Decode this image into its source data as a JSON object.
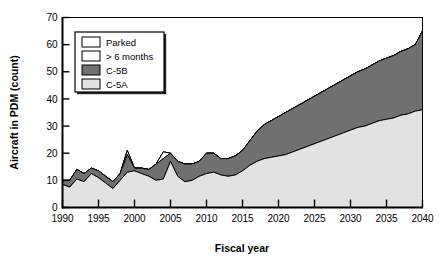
{
  "chart_data": {
    "type": "area",
    "title": "",
    "subtitle": "",
    "xlabel": "Fiscal year",
    "ylabel": "Aircraft in PDM (count)",
    "xlim": [
      1990,
      2040
    ],
    "ylim": [
      0,
      70
    ],
    "xticks": [
      1990,
      1995,
      2000,
      2005,
      2010,
      2015,
      2020,
      2025,
      2030,
      2035,
      2040
    ],
    "yticks": [
      0,
      10,
      20,
      30,
      40,
      50,
      60,
      70
    ],
    "grid": false,
    "stacked": true,
    "legend_position": "top-left-inside",
    "x": [
      1990,
      1991,
      1992,
      1993,
      1994,
      1995,
      1996,
      1997,
      1998,
      1999,
      2000,
      2001,
      2002,
      2003,
      2004,
      2005,
      2006,
      2007,
      2008,
      2009,
      2010,
      2011,
      2012,
      2013,
      2014,
      2015,
      2016,
      2017,
      2018,
      2019,
      2020,
      2021,
      2022,
      2023,
      2024,
      2025,
      2026,
      2027,
      2028,
      2029,
      2030,
      2031,
      2032,
      2033,
      2034,
      2035,
      2036,
      2037,
      2038,
      2039,
      2040
    ],
    "series": [
      {
        "name": "C-5A",
        "color": "#e2e2e2",
        "values": [
          8.5,
          7.5,
          10.5,
          9.5,
          12.5,
          11.0,
          9.0,
          7.0,
          10.0,
          13.0,
          13.5,
          12.5,
          11.5,
          10.0,
          10.5,
          17.0,
          11.5,
          9.5,
          10.0,
          11.5,
          12.5,
          13.0,
          12.0,
          11.5,
          12.0,
          13.5,
          15.5,
          17.0,
          18.0,
          18.5,
          19.0,
          19.5,
          20.5,
          21.5,
          22.5,
          23.5,
          24.5,
          25.5,
          26.5,
          27.5,
          28.5,
          29.5,
          30.0,
          31.0,
          32.0,
          32.5,
          33.0,
          34.0,
          34.5,
          35.5,
          36.0
        ]
      },
      {
        "name": "C-5B",
        "color": "#707070",
        "values": [
          1.5,
          2.5,
          3.5,
          3.0,
          2.0,
          2.5,
          2.5,
          2.5,
          2.5,
          6.5,
          1.0,
          2.0,
          2.5,
          6.0,
          7.5,
          3.0,
          5.5,
          6.5,
          6.0,
          5.5,
          7.5,
          7.0,
          6.0,
          6.5,
          7.0,
          7.5,
          9.0,
          11.0,
          12.5,
          13.5,
          14.5,
          15.5,
          16.0,
          16.5,
          17.0,
          17.5,
          18.0,
          18.5,
          19.0,
          19.5,
          20.0,
          20.5,
          21.0,
          21.5,
          22.0,
          22.5,
          23.0,
          23.5,
          24.0,
          24.5,
          29.0
        ]
      },
      {
        "name": "> 6 months",
        "color": "#ffffff",
        "values": [
          0,
          0,
          0,
          0,
          0,
          0,
          0,
          0,
          0,
          1.5,
          0,
          0,
          0,
          0,
          2.5,
          0,
          0,
          0,
          0,
          0,
          0,
          0,
          0,
          0,
          0,
          0,
          0,
          0,
          0,
          0,
          0,
          0,
          0,
          0,
          0,
          0,
          0,
          0,
          0,
          0,
          0,
          0,
          0,
          0,
          0,
          0,
          0,
          0,
          0,
          0,
          0
        ]
      },
      {
        "name": "Parked",
        "color": "#ffffff",
        "values": [
          0,
          0,
          0,
          0,
          0,
          0,
          0,
          0,
          0,
          0,
          0,
          0,
          0,
          0,
          0,
          0,
          0,
          0,
          0,
          0,
          0,
          0,
          0,
          0,
          0,
          0,
          0,
          0,
          0,
          0,
          0,
          0,
          0,
          0,
          0,
          0,
          0,
          0,
          0,
          0,
          0,
          0,
          0,
          0,
          0,
          0,
          0,
          0,
          0,
          0,
          0
        ]
      }
    ],
    "legend": [
      {
        "label": "Parked",
        "color": "#ffffff"
      },
      {
        "label": "> 6 months",
        "color": "#ffffff"
      },
      {
        "label": "C-5B",
        "color": "#707070"
      },
      {
        "label": "C-5A",
        "color": "#e2e2e2"
      }
    ]
  },
  "axes": {
    "y_title": "Aircraft in PDM (count)",
    "x_title": "Fiscal year",
    "x_tick_labels": [
      "1990",
      "1995",
      "2000",
      "2005",
      "2010",
      "2015",
      "2020",
      "2025",
      "2030",
      "2035",
      "2040"
    ],
    "y_tick_labels": [
      "0",
      "10",
      "20",
      "30",
      "40",
      "50",
      "60",
      "70"
    ]
  },
  "legend_box": {
    "items": [
      "Parked",
      "> 6 months",
      "C-5B",
      "C-5A"
    ]
  },
  "colors": {
    "c5a": "#e2e2e2",
    "c5b": "#707070",
    "parked": "#ffffff",
    "over6months": "#ffffff",
    "axis": "#000000",
    "background": "#ffffff"
  }
}
